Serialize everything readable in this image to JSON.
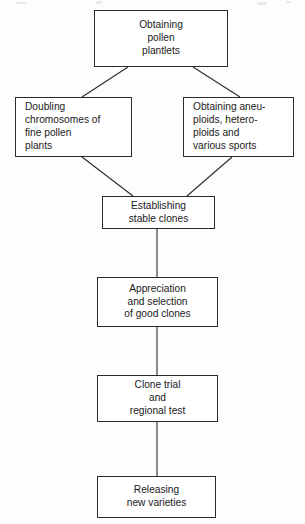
{
  "diagram": {
    "type": "flowchart",
    "orientation": "top-to-bottom",
    "nodes": [
      {
        "id": "obtaining-pollen-plantlets",
        "label": "Obtaining\npollen\nplantlets",
        "align": "center",
        "x": 94,
        "y": 10,
        "w": 134,
        "h": 57
      },
      {
        "id": "doubling-chromosomes",
        "label": "Doubling\nchromosomes of\nfine pollen\nplants",
        "align": "left",
        "x": 15,
        "y": 97,
        "w": 117,
        "h": 60
      },
      {
        "id": "obtaining-aneuploids",
        "label": "Obtaining aneu-\nploids, hetero-\nploids and\nvarious sports",
        "align": "left",
        "x": 183,
        "y": 97,
        "w": 111,
        "h": 60
      },
      {
        "id": "establishing-stable-clones",
        "label": "Establishing\nstable clones",
        "align": "center",
        "x": 102,
        "y": 196,
        "w": 113,
        "h": 33
      },
      {
        "id": "appreciation-selection",
        "label": "Appreciation\nand selection\nof good clones",
        "align": "center",
        "x": 97,
        "y": 277,
        "w": 121,
        "h": 50
      },
      {
        "id": "clone-trial-regional-test",
        "label": "Clone trial\nand\nregional test",
        "align": "center",
        "x": 97,
        "y": 375,
        "w": 121,
        "h": 47
      },
      {
        "id": "releasing-new-varieties",
        "label": "Releasing\nnew varieties",
        "align": "center",
        "x": 97,
        "y": 476,
        "w": 119,
        "h": 42
      }
    ],
    "edges": [
      {
        "id": "edge-plantlets-to-doubling",
        "from": "obtaining-pollen-plantlets",
        "to": "doubling-chromosomes",
        "kind": "diagonal",
        "x1": 128,
        "y1": 67,
        "x2": 82,
        "y2": 97
      },
      {
        "id": "edge-plantlets-to-aneuploids",
        "from": "obtaining-pollen-plantlets",
        "to": "obtaining-aneuploids",
        "kind": "diagonal",
        "x1": 193,
        "y1": 67,
        "x2": 240,
        "y2": 97
      },
      {
        "id": "edge-doubling-to-establishing",
        "from": "doubling-chromosomes",
        "to": "establishing-stable-clones",
        "kind": "diagonal",
        "x1": 82,
        "y1": 157,
        "x2": 133,
        "y2": 196
      },
      {
        "id": "edge-aneuploids-to-establishing",
        "from": "obtaining-aneuploids",
        "to": "establishing-stable-clones",
        "kind": "diagonal",
        "x1": 232,
        "y1": 157,
        "x2": 187,
        "y2": 196
      },
      {
        "id": "edge-establishing-to-appreciation",
        "from": "establishing-stable-clones",
        "to": "appreciation-selection",
        "kind": "vertical",
        "x1": 157,
        "y1": 229,
        "x2": 157,
        "y2": 277
      },
      {
        "id": "edge-appreciation-to-clone-trial",
        "from": "appreciation-selection",
        "to": "clone-trial-regional-test",
        "kind": "vertical",
        "x1": 157,
        "y1": 327,
        "x2": 157,
        "y2": 375
      },
      {
        "id": "edge-clone-trial-to-releasing",
        "from": "clone-trial-regional-test",
        "to": "releasing-new-varieties",
        "kind": "vertical",
        "x1": 157,
        "y1": 422,
        "x2": 157,
        "y2": 476
      }
    ],
    "colors": {
      "stroke": "#2b2b2b",
      "text": "#1a1a1a",
      "background": "#fdfdfd",
      "node_fill": "#ffffff"
    }
  }
}
